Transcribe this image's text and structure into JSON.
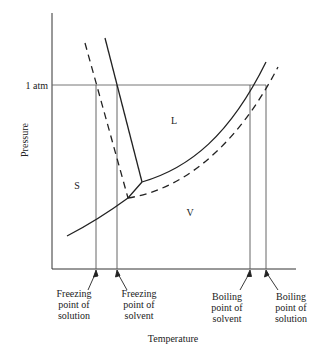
{
  "diagram": {
    "axes": {
      "xlabel": "Temperature",
      "ylabel": "Pressure",
      "y_tick": "1 atm"
    },
    "regions": {
      "solid": "S",
      "liquid": "L",
      "vapor": "V"
    },
    "annotations": {
      "freezing_solution": [
        "Freezing",
        "point of",
        "solution"
      ],
      "freezing_solvent": [
        "Freezing",
        "point of",
        "solvent"
      ],
      "boiling_solvent": [
        "Boiling",
        "point of",
        "solvent"
      ],
      "boiling_solution": [
        "Boiling",
        "point of",
        "solution"
      ]
    },
    "legend_semantics": {
      "solid_line": "pure solvent",
      "dashed_line": "solution"
    },
    "colors": {
      "line": "#222222",
      "guide": "#555555",
      "background": "#ffffff"
    }
  }
}
